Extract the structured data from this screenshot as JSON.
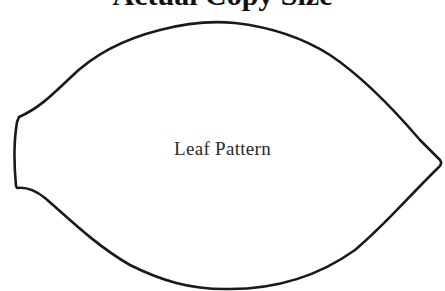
{
  "document": {
    "heading": "Actual Copy Size",
    "heading_visibility": "clipped at top edge; only glyph descenders visible",
    "pattern": {
      "label": "Leaf Pattern",
      "shape": "leaf outline",
      "stroke_color": "#1a1a1a",
      "fill_color": "#ffffff",
      "outline_points": {
        "top_peak": [
          225,
          22
        ],
        "left_top_corner": [
          19,
          117
        ],
        "left_bottom_corner": [
          16,
          187
        ],
        "right_tip": [
          441,
          163
        ],
        "bottom_low": [
          225,
          289
        ]
      }
    }
  }
}
